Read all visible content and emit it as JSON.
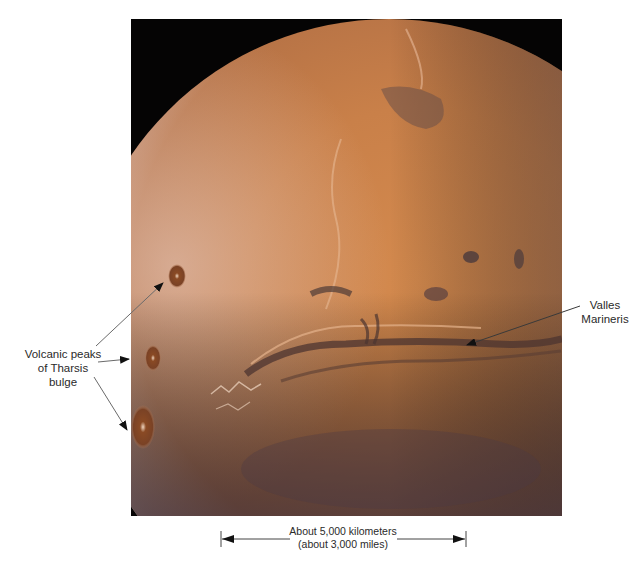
{
  "figure": {
    "colors": {
      "space": "#050404",
      "surface_light": "#d9985f",
      "surface_mid": "#c27a45",
      "surface_dark": "#5a4038",
      "annotation": "#2a2a2a"
    }
  },
  "annotations": {
    "volcanic_peaks": {
      "lines": [
        "Volcanic peaks",
        "of Tharsis",
        "bulge"
      ]
    },
    "valles_marineris": {
      "lines": [
        "Valles",
        "Marineris"
      ]
    }
  },
  "scale_bar": {
    "line1": "About 5,000 kilometers",
    "line2": "(about 3,000 miles)"
  }
}
